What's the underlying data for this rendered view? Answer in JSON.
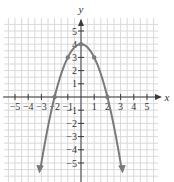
{
  "chart_data": {
    "type": "line",
    "title": "",
    "function": "y = 4 - x^2",
    "xlabel": "x",
    "ylabel": "y",
    "xlim": [
      -5.5,
      5.5
    ],
    "ylim": [
      -6,
      6
    ],
    "grid": true,
    "x_ticks": [
      -5,
      -4,
      -3,
      -2,
      -1,
      1,
      2,
      3,
      4,
      5
    ],
    "y_ticks": [
      5,
      4,
      3,
      2,
      1,
      -1,
      -2,
      -3,
      -4,
      -5
    ],
    "series": [
      {
        "name": "parabola",
        "color": "#7a7a7a",
        "marked_points": [
          {
            "x": -2,
            "y": 0
          },
          {
            "x": -1,
            "y": 3
          },
          {
            "x": 0,
            "y": 4
          },
          {
            "x": 1,
            "y": 3
          },
          {
            "x": 2,
            "y": 0
          }
        ],
        "arrows": "both ends, pointing downward"
      }
    ]
  },
  "labels": {
    "x_axis": "x",
    "y_axis": "y",
    "x_tick_labels": [
      "−5",
      "−4",
      "−3",
      "−2",
      "−1",
      "1",
      "2",
      "3",
      "4",
      "5"
    ],
    "y_tick_labels": [
      "5",
      "4",
      "3",
      "2",
      "1",
      "−1",
      "−2",
      "−3",
      "−4",
      "−5"
    ]
  },
  "colors": {
    "grid": "#d9d9d9",
    "axes": "#3a3a3a",
    "curve": "#7a7a7a"
  }
}
